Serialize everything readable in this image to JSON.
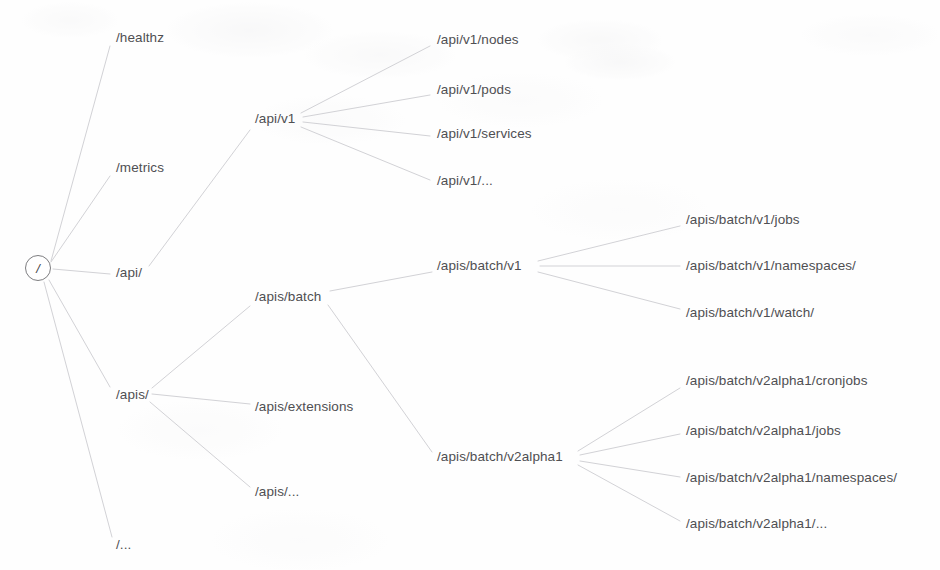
{
  "diagram": {
    "type": "tree",
    "orientation": "left-to-right",
    "canvas": {
      "width": 940,
      "height": 570
    },
    "style": {
      "background_color": "#fefefe",
      "text_color": "#4f4f52",
      "edge_color": "#d2d2d6",
      "root_stroke_color": "#7d7d80",
      "font_size_px": 13.5,
      "edge_width_px": 1
    }
  },
  "root": {
    "id": "root",
    "label": "/",
    "shape": "circle",
    "x": 38,
    "y": 268
  },
  "nodes": [
    {
      "id": "healthz",
      "label": "/healthz",
      "x": 116,
      "y": 38,
      "level": 1
    },
    {
      "id": "metrics",
      "label": "/metrics",
      "x": 116,
      "y": 168,
      "level": 1
    },
    {
      "id": "api",
      "label": "/api/",
      "x": 116,
      "y": 273,
      "level": 1
    },
    {
      "id": "apis",
      "label": "/apis/",
      "x": 116,
      "y": 395,
      "level": 1
    },
    {
      "id": "root-ellipsis",
      "label": "/...",
      "x": 116,
      "y": 545,
      "level": 1
    },
    {
      "id": "api-v1",
      "label": "/api/v1",
      "x": 255,
      "y": 119,
      "level": 2
    },
    {
      "id": "apis-batch",
      "label": "/apis/batch",
      "x": 255,
      "y": 297,
      "level": 2
    },
    {
      "id": "apis-extensions",
      "label": "/apis/extensions",
      "x": 255,
      "y": 407,
      "level": 2
    },
    {
      "id": "apis-ellipsis",
      "label": "/apis/...",
      "x": 255,
      "y": 492,
      "level": 2
    },
    {
      "id": "api-v1-nodes",
      "label": "/api/v1/nodes",
      "x": 437,
      "y": 40,
      "level": 3
    },
    {
      "id": "api-v1-pods",
      "label": "/api/v1/pods",
      "x": 437,
      "y": 90,
      "level": 3
    },
    {
      "id": "api-v1-services",
      "label": "/api/v1/services",
      "x": 437,
      "y": 134,
      "level": 3
    },
    {
      "id": "api-v1-ellipsis",
      "label": "/api/v1/...",
      "x": 437,
      "y": 181,
      "level": 3
    },
    {
      "id": "batch-v1",
      "label": "/apis/batch/v1",
      "x": 437,
      "y": 266,
      "level": 3
    },
    {
      "id": "batch-v2alpha1",
      "label": "/apis/batch/v2alpha1",
      "x": 437,
      "y": 457,
      "level": 3
    },
    {
      "id": "batch-v1-jobs",
      "label": "/apis/batch/v1/jobs",
      "x": 686,
      "y": 220,
      "level": 4
    },
    {
      "id": "batch-v1-ns",
      "label": "/apis/batch/v1/namespaces/",
      "x": 686,
      "y": 266,
      "level": 4
    },
    {
      "id": "batch-v1-watch",
      "label": "/apis/batch/v1/watch/",
      "x": 686,
      "y": 313,
      "level": 4
    },
    {
      "id": "v2a1-cronjobs",
      "label": "/apis/batch/v2alpha1/cronjobs",
      "x": 686,
      "y": 381,
      "level": 4
    },
    {
      "id": "v2a1-jobs",
      "label": "/apis/batch/v2alpha1/jobs",
      "x": 686,
      "y": 431,
      "level": 4
    },
    {
      "id": "v2a1-ns",
      "label": "/apis/batch/v2alpha1/namespaces/",
      "x": 686,
      "y": 478,
      "level": 4
    },
    {
      "id": "v2a1-ellipsis",
      "label": "/apis/batch/v2alpha1/...",
      "x": 686,
      "y": 524,
      "level": 4
    }
  ],
  "edges": [
    {
      "from": "root",
      "to": "healthz",
      "x1": 51,
      "y1": 261,
      "x2": 110,
      "y2": 46
    },
    {
      "from": "root",
      "to": "metrics",
      "x1": 51,
      "y1": 262,
      "x2": 110,
      "y2": 176
    },
    {
      "from": "root",
      "to": "api",
      "x1": 53,
      "y1": 269,
      "x2": 110,
      "y2": 274
    },
    {
      "from": "root",
      "to": "apis",
      "x1": 49,
      "y1": 280,
      "x2": 110,
      "y2": 387
    },
    {
      "from": "root",
      "to": "root-ellipsis",
      "x1": 44,
      "y1": 282,
      "x2": 112,
      "y2": 537
    },
    {
      "from": "api",
      "to": "api-v1",
      "x1": 149,
      "y1": 266,
      "x2": 250,
      "y2": 130
    },
    {
      "from": "apis",
      "to": "apis-batch",
      "x1": 152,
      "y1": 388,
      "x2": 250,
      "y2": 306
    },
    {
      "from": "apis",
      "to": "apis-extensions",
      "x1": 152,
      "y1": 394,
      "x2": 250,
      "y2": 404
    },
    {
      "from": "apis",
      "to": "apis-ellipsis",
      "x1": 150,
      "y1": 402,
      "x2": 250,
      "y2": 487
    },
    {
      "from": "api-v1",
      "to": "api-v1-nodes",
      "x1": 301,
      "y1": 113,
      "x2": 430,
      "y2": 46
    },
    {
      "from": "api-v1",
      "to": "api-v1-pods",
      "x1": 303,
      "y1": 117,
      "x2": 430,
      "y2": 95
    },
    {
      "from": "api-v1",
      "to": "api-v1-services",
      "x1": 303,
      "y1": 122,
      "x2": 430,
      "y2": 136
    },
    {
      "from": "api-v1",
      "to": "api-v1-ellipsis",
      "x1": 301,
      "y1": 127,
      "x2": 430,
      "y2": 180
    },
    {
      "from": "apis-batch",
      "to": "batch-v1",
      "x1": 330,
      "y1": 291,
      "x2": 432,
      "y2": 272
    },
    {
      "from": "apis-batch",
      "to": "batch-v2alpha1",
      "x1": 328,
      "y1": 305,
      "x2": 432,
      "y2": 452
    },
    {
      "from": "batch-v1",
      "to": "batch-v1-jobs",
      "x1": 538,
      "y1": 261,
      "x2": 680,
      "y2": 226
    },
    {
      "from": "batch-v1",
      "to": "batch-v1-ns",
      "x1": 540,
      "y1": 266,
      "x2": 680,
      "y2": 266
    },
    {
      "from": "batch-v1",
      "to": "batch-v1-watch",
      "x1": 538,
      "y1": 272,
      "x2": 680,
      "y2": 309
    },
    {
      "from": "batch-v2alpha1",
      "to": "v2a1-cronjobs",
      "x1": 578,
      "y1": 451,
      "x2": 680,
      "y2": 388
    },
    {
      "from": "batch-v2alpha1",
      "to": "v2a1-jobs",
      "x1": 580,
      "y1": 455,
      "x2": 680,
      "y2": 434
    },
    {
      "from": "batch-v2alpha1",
      "to": "v2a1-ns",
      "x1": 580,
      "y1": 461,
      "x2": 680,
      "y2": 477
    },
    {
      "from": "batch-v2alpha1",
      "to": "v2a1-ellipsis",
      "x1": 578,
      "y1": 465,
      "x2": 680,
      "y2": 521
    }
  ]
}
